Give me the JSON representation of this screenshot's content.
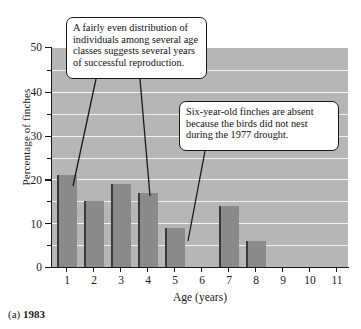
{
  "caption": {
    "prefix": "(a)",
    "year": "1983"
  },
  "annotations": [
    {
      "id": "distribution",
      "lines": [
        "A fairly even distribution of",
        "individuals among several age",
        "classes suggests several years",
        "of successful reproduction."
      ]
    },
    {
      "id": "absent",
      "lines": [
        "Six-year-old finches are absent",
        "because the birds did not nest",
        "during the 1977 drought."
      ]
    }
  ],
  "chart_data": {
    "type": "bar",
    "title": "",
    "xlabel": "Age (years)",
    "ylabel": "Percentage of finches",
    "categories": [
      "1",
      "2",
      "3",
      "4",
      "5",
      "6",
      "7",
      "8",
      "9",
      "10",
      "11"
    ],
    "values": [
      21,
      15,
      19,
      17,
      9,
      0,
      14,
      6,
      0,
      0,
      0
    ],
    "ylim": [
      0,
      50
    ],
    "xlim": [
      0,
      11
    ],
    "ytick_labels": [
      "0",
      "10",
      "20",
      "30",
      "40",
      "50"
    ],
    "ytick_values": [
      0,
      10,
      20,
      30,
      40,
      50
    ],
    "yminor_values": [
      5,
      15,
      25,
      35,
      45
    ],
    "grid": true,
    "legend": "none",
    "colors": {
      "bar_fill": "#8a8a88",
      "bar_edge": "#3c3c3c",
      "plot_background": "#b6b6b4",
      "gridline": "#f1f1ed",
      "axis": "#1a1a1a",
      "callout_background": "#ffffff",
      "callout_border": "#1a1a1a"
    }
  }
}
